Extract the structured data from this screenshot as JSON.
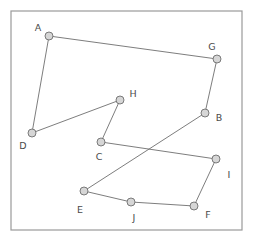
{
  "figure": {
    "background_color": "#ffffff",
    "frame_color": "#9a9a9a",
    "edge_color": "#6e6e6e",
    "node_fill_color": "#d6d6d6",
    "node_stroke_color": "#6e6e6e",
    "label_color": "#4a4a4a",
    "node_radius": 4.0
  },
  "frame": {
    "x": 11,
    "y": 11,
    "width": 231,
    "height": 219
  },
  "chart_data": {
    "type": "scatter",
    "xlabel": "",
    "ylabel": "",
    "grid": false,
    "legend": "none",
    "xlim": [
      11,
      242
    ],
    "ylim": [
      11,
      230
    ],
    "nodes": [
      {
        "id": "A",
        "label": "A",
        "x": 49,
        "y": 36,
        "label_x": 38,
        "label_y": 28
      },
      {
        "id": "G",
        "label": "G",
        "x": 217,
        "y": 59,
        "label_x": 212,
        "label_y": 47
      },
      {
        "id": "D",
        "label": "D",
        "x": 32,
        "y": 133,
        "label_x": 23,
        "label_y": 146
      },
      {
        "id": "H",
        "label": "H",
        "x": 120,
        "y": 100,
        "label_x": 133,
        "label_y": 94
      },
      {
        "id": "B",
        "label": "B",
        "x": 205,
        "y": 113,
        "label_x": 219,
        "label_y": 118
      },
      {
        "id": "C",
        "label": "C",
        "x": 101,
        "y": 142,
        "label_x": 99,
        "label_y": 157
      },
      {
        "id": "I",
        "label": "I",
        "x": 216,
        "y": 159,
        "label_x": 229,
        "label_y": 175
      },
      {
        "id": "E",
        "label": "E",
        "x": 84,
        "y": 191,
        "label_x": 80,
        "label_y": 210
      },
      {
        "id": "J",
        "label": "J",
        "x": 131,
        "y": 202,
        "label_x": 134,
        "label_y": 218
      },
      {
        "id": "F",
        "label": "F",
        "x": 194,
        "y": 206,
        "label_x": 208,
        "label_y": 215
      }
    ],
    "edges": [
      {
        "from": "A",
        "to": "G"
      },
      {
        "from": "A",
        "to": "D"
      },
      {
        "from": "D",
        "to": "H"
      },
      {
        "from": "H",
        "to": "C"
      },
      {
        "from": "C",
        "to": "I"
      },
      {
        "from": "G",
        "to": "B"
      },
      {
        "from": "B",
        "to": "E"
      },
      {
        "from": "E",
        "to": "J"
      },
      {
        "from": "J",
        "to": "F"
      },
      {
        "from": "F",
        "to": "I"
      }
    ]
  }
}
